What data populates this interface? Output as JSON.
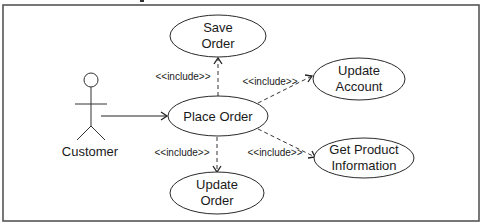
{
  "diagram": {
    "type": "uml-use-case",
    "actor": {
      "name": "Customer"
    },
    "use_cases": {
      "place_order": {
        "lines": [
          "Place Order"
        ]
      },
      "save_order": {
        "lines": [
          "Save",
          "Order"
        ]
      },
      "update_account": {
        "lines": [
          "Update",
          "Account"
        ]
      },
      "get_product_info": {
        "lines": [
          "Get Product",
          "Information"
        ]
      },
      "update_order": {
        "lines": [
          "Update",
          "Order"
        ]
      }
    },
    "relationships": [
      {
        "from": "Customer",
        "to": "Place Order",
        "kind": "association"
      },
      {
        "from": "Place Order",
        "to": "Save Order",
        "kind": "include",
        "label": "<<include>>"
      },
      {
        "from": "Place Order",
        "to": "Update Account",
        "kind": "include",
        "label": "<<include>>"
      },
      {
        "from": "Place Order",
        "to": "Get Product Information",
        "kind": "include",
        "label": "<<include>>"
      },
      {
        "from": "Place Order",
        "to": "Update Order",
        "kind": "include",
        "label": "<<include>>"
      }
    ]
  }
}
